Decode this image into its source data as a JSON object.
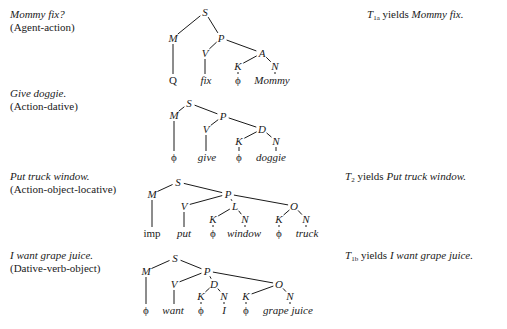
{
  "rows": [
    {
      "sentence": "Mommy fix?",
      "relation": "(Agent-action)",
      "yield": {
        "t": "T",
        "sub": "1a",
        "word": " yields ",
        "result": "Mommy fix."
      },
      "tree": {
        "nodes": [
          {
            "id": "S",
            "label": "S",
            "x": 205,
            "y": 16
          },
          {
            "id": "M",
            "label": "M",
            "x": 173,
            "y": 42
          },
          {
            "id": "P",
            "label": "P",
            "x": 221,
            "y": 42
          },
          {
            "id": "V",
            "label": "V",
            "x": 205,
            "y": 57
          },
          {
            "id": "A",
            "label": "A",
            "x": 262,
            "y": 57
          },
          {
            "id": "K",
            "label": "K",
            "x": 238,
            "y": 70
          },
          {
            "id": "N",
            "label": "N",
            "x": 275,
            "y": 70
          }
        ],
        "leaves": [
          {
            "label": "Q",
            "x": 173,
            "y": 84,
            "style": "rm",
            "parent": "M"
          },
          {
            "label": "fix",
            "x": 206,
            "y": 84,
            "style": "it",
            "parent": "V"
          },
          {
            "label": "ϕ",
            "x": 238,
            "y": 84,
            "style": "rm",
            "parent": "K"
          },
          {
            "label": "Mommy",
            "x": 272,
            "y": 84,
            "style": "it",
            "parent": "N"
          }
        ],
        "edges": [
          [
            "S",
            "M"
          ],
          [
            "S",
            "P"
          ],
          [
            "P",
            "V"
          ],
          [
            "P",
            "A"
          ],
          [
            "A",
            "K"
          ],
          [
            "A",
            "N"
          ]
        ]
      }
    },
    {
      "sentence": "Give doggie.",
      "relation": "(Action-dative)",
      "yield": null,
      "tree": {
        "nodes": [
          {
            "id": "S",
            "label": "S",
            "x": 189,
            "y": 107
          },
          {
            "id": "M",
            "label": "M",
            "x": 174,
            "y": 119
          },
          {
            "id": "P",
            "label": "P",
            "x": 223,
            "y": 120
          },
          {
            "id": "V",
            "label": "V",
            "x": 206,
            "y": 133
          },
          {
            "id": "D",
            "label": "D",
            "x": 262,
            "y": 133
          },
          {
            "id": "K",
            "label": "K",
            "x": 239,
            "y": 145
          },
          {
            "id": "N",
            "label": "N",
            "x": 276,
            "y": 145
          }
        ],
        "leaves": [
          {
            "label": "ϕ",
            "x": 174,
            "y": 161,
            "style": "rm",
            "parent": "M"
          },
          {
            "label": "give",
            "x": 207,
            "y": 161,
            "style": "it",
            "parent": "V"
          },
          {
            "label": "ϕ",
            "x": 239,
            "y": 161,
            "style": "rm",
            "parent": "K"
          },
          {
            "label": "doggie",
            "x": 271,
            "y": 161,
            "style": "it",
            "parent": "N"
          }
        ],
        "edges": [
          [
            "S",
            "M"
          ],
          [
            "S",
            "P"
          ],
          [
            "P",
            "V"
          ],
          [
            "P",
            "D"
          ],
          [
            "D",
            "K"
          ],
          [
            "D",
            "N"
          ]
        ]
      }
    },
    {
      "sentence": "Put truck window.",
      "relation": "(Action-object-locative)",
      "yield": {
        "t": "T",
        "sub": "2",
        "word": " yields ",
        "result": "Put truck window."
      },
      "tree": {
        "nodes": [
          {
            "id": "S",
            "label": "S",
            "x": 178,
            "y": 186
          },
          {
            "id": "M",
            "label": "M",
            "x": 152,
            "y": 198
          },
          {
            "id": "P",
            "label": "P",
            "x": 228,
            "y": 198
          },
          {
            "id": "V",
            "label": "V",
            "x": 184,
            "y": 210
          },
          {
            "id": "L",
            "label": "L",
            "x": 235,
            "y": 210
          },
          {
            "id": "O",
            "label": "O",
            "x": 294,
            "y": 210
          },
          {
            "id": "K1",
            "label": "K",
            "x": 213,
            "y": 223
          },
          {
            "id": "N1",
            "label": "N",
            "x": 245,
            "y": 223
          },
          {
            "id": "K2",
            "label": "K",
            "x": 279,
            "y": 223
          },
          {
            "id": "N2",
            "label": "N",
            "x": 306,
            "y": 223
          }
        ],
        "leaves": [
          {
            "label": "imp",
            "x": 152,
            "y": 237,
            "style": "rm",
            "parent": "M"
          },
          {
            "label": "put",
            "x": 184,
            "y": 237,
            "style": "it",
            "parent": "V"
          },
          {
            "label": "ϕ",
            "x": 213,
            "y": 237,
            "style": "rm",
            "parent": "K1"
          },
          {
            "label": "window",
            "x": 244,
            "y": 237,
            "style": "it",
            "parent": "N1"
          },
          {
            "label": "ϕ",
            "x": 279,
            "y": 237,
            "style": "rm",
            "parent": "K2"
          },
          {
            "label": "truck",
            "x": 307,
            "y": 237,
            "style": "it",
            "parent": "N2"
          }
        ],
        "edges": [
          [
            "S",
            "M"
          ],
          [
            "S",
            "P"
          ],
          [
            "P",
            "V"
          ],
          [
            "P",
            "L"
          ],
          [
            "P",
            "O"
          ],
          [
            "L",
            "K1"
          ],
          [
            "L",
            "N1"
          ],
          [
            "O",
            "K2"
          ],
          [
            "O",
            "N2"
          ]
        ]
      }
    },
    {
      "sentence": "I want grape juice.",
      "relation": "(Dative-verb-object)",
      "yield": {
        "t": "T",
        "sub": "1b",
        "word": " yields ",
        "result": "I want grape juice."
      },
      "tree": {
        "nodes": [
          {
            "id": "S",
            "label": "S",
            "x": 175,
            "y": 262
          },
          {
            "id": "M",
            "label": "M",
            "x": 146,
            "y": 275
          },
          {
            "id": "P",
            "label": "P",
            "x": 207,
            "y": 275
          },
          {
            "id": "V",
            "label": "V",
            "x": 174,
            "y": 288
          },
          {
            "id": "D",
            "label": "D",
            "x": 214,
            "y": 288
          },
          {
            "id": "O",
            "label": "O",
            "x": 279,
            "y": 288
          },
          {
            "id": "K1",
            "label": "K",
            "x": 201,
            "y": 300
          },
          {
            "id": "N1",
            "label": "N",
            "x": 224,
            "y": 300
          },
          {
            "id": "K2",
            "label": "K",
            "x": 246,
            "y": 300
          },
          {
            "id": "N2",
            "label": "N",
            "x": 290,
            "y": 300
          }
        ],
        "leaves": [
          {
            "label": "ϕ",
            "x": 146,
            "y": 314,
            "style": "rm",
            "parent": "M"
          },
          {
            "label": "want",
            "x": 173,
            "y": 314,
            "style": "it",
            "parent": "V"
          },
          {
            "label": "ϕ",
            "x": 201,
            "y": 314,
            "style": "rm",
            "parent": "K1"
          },
          {
            "label": "I",
            "x": 224,
            "y": 314,
            "style": "it",
            "parent": "N1"
          },
          {
            "label": "ϕ",
            "x": 246,
            "y": 314,
            "style": "rm",
            "parent": "K2"
          },
          {
            "label": "grape juice",
            "x": 288,
            "y": 314,
            "style": "it",
            "parent": "N2"
          }
        ],
        "edges": [
          [
            "S",
            "M"
          ],
          [
            "S",
            "P"
          ],
          [
            "P",
            "V"
          ],
          [
            "P",
            "D"
          ],
          [
            "P",
            "O"
          ],
          [
            "D",
            "K1"
          ],
          [
            "D",
            "N1"
          ],
          [
            "O",
            "K2"
          ],
          [
            "O",
            "N2"
          ]
        ]
      }
    }
  ],
  "layout": {
    "label_tops": [
      8,
      87,
      170,
      249
    ],
    "yield_positions": [
      {
        "left": 367,
        "top": 8
      },
      null,
      {
        "left": 345,
        "top": 170
      },
      {
        "left": 345,
        "top": 249
      }
    ]
  }
}
